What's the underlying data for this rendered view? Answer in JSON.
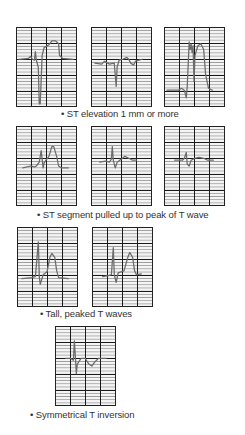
{
  "sections": [
    {
      "caption": "• ST elevation 1 mm or more",
      "panels": 3
    },
    {
      "caption": "• ST segment pulled up to peak of T wave",
      "panels": 3
    },
    {
      "caption": "• Tall, peaked T waves",
      "panels": 2
    },
    {
      "caption": "• Symmetrical T inversion",
      "panels": 1
    }
  ],
  "colors": {
    "trace": "#6b6b6b",
    "grid_major": "#1a1a1a",
    "grid_minor": "#9a9a9a",
    "text": "#333333"
  }
}
